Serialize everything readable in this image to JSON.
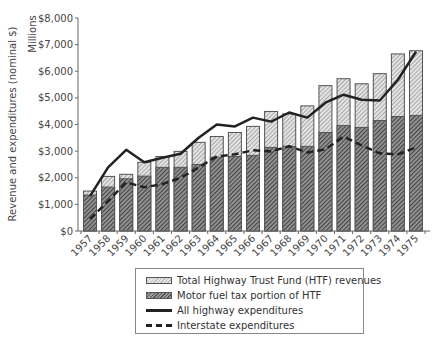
{
  "chart_data": {
    "type": "bar",
    "title": "",
    "xlabel": "",
    "ylabel": "Revenue and expenditures (nominal $)",
    "yunit_label": "Millions",
    "ylim": [
      0,
      8000
    ],
    "yticks": [
      "$0",
      "$1,000",
      "$2,000",
      "$3,000",
      "$4,000",
      "$5,000",
      "$6,000",
      "$7,000",
      "$8,000"
    ],
    "grid": false,
    "legend_position": "bottom",
    "categories": [
      "1957",
      "1958",
      "1959",
      "1960",
      "1961",
      "1962",
      "1963",
      "1964",
      "1965",
      "1966",
      "1967",
      "1968",
      "1969",
      "1970",
      "1971",
      "1972",
      "1973",
      "1974",
      "1975"
    ],
    "series": [
      {
        "name": "Total Highway Trust Fund (HTF) revenues",
        "kind": "bar",
        "pattern": "light-hatch",
        "values": [
          1500,
          2050,
          2130,
          2580,
          2800,
          2990,
          3330,
          3550,
          3700,
          3930,
          4490,
          4400,
          4700,
          5460,
          5720,
          5530,
          5910,
          6650,
          6770
        ]
      },
      {
        "name": "Motor fuel tax portion of HTF",
        "kind": "bar",
        "pattern": "dark-hatch",
        "values": [
          1350,
          1650,
          1960,
          2060,
          2390,
          2390,
          2500,
          2770,
          2800,
          2840,
          3140,
          3180,
          3180,
          3700,
          3960,
          3890,
          4150,
          4300,
          4340
        ]
      },
      {
        "name": "All highway expenditures",
        "kind": "line",
        "style": "solid",
        "values": [
          1310,
          2390,
          3050,
          2580,
          2750,
          2900,
          3500,
          4000,
          3930,
          4260,
          4110,
          4450,
          4260,
          4820,
          5120,
          4930,
          4900,
          5680,
          6730
        ]
      },
      {
        "name": "Interstate expenditures",
        "kind": "line",
        "style": "dashed",
        "values": [
          450,
          1120,
          1830,
          1640,
          1760,
          2000,
          2390,
          2800,
          2880,
          3030,
          2990,
          3180,
          2950,
          3070,
          3550,
          3210,
          2920,
          2880,
          3140
        ]
      }
    ]
  },
  "legend": {
    "items": [
      "Total Highway Trust Fund (HTF) revenues",
      "Motor fuel tax portion of HTF",
      "All highway expenditures",
      "Interstate expenditures"
    ]
  },
  "colors": {
    "line": "#222222",
    "bar_border": "#555555",
    "axis": "#666666"
  }
}
